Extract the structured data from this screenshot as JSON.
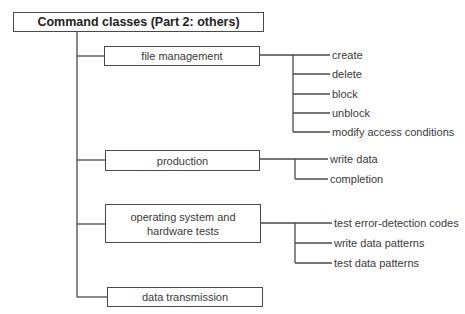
{
  "diagram": {
    "title": "Command classes (Part 2: others)",
    "categories": [
      {
        "label": "file management",
        "children": [
          "create",
          "delete",
          "block",
          "unblock",
          "modify access conditions"
        ]
      },
      {
        "label": "production",
        "children": [
          "write data",
          "completion"
        ]
      },
      {
        "label": "operating system and hardware tests",
        "label_lines": [
          "operating system and",
          "hardware tests"
        ],
        "children": [
          "test error-detection codes",
          "write data patterns",
          "test data patterns"
        ]
      },
      {
        "label": "data transmission",
        "children": []
      }
    ]
  }
}
